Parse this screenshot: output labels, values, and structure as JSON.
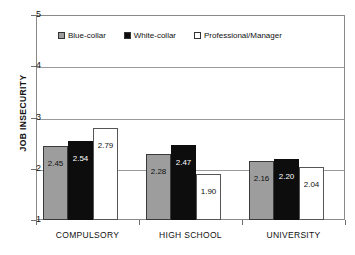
{
  "chart_data": {
    "type": "bar",
    "title": "",
    "xlabel": "",
    "ylabel": "JOB INSECURITY",
    "categories": [
      "COMPULSORY",
      "HIGH SCHOOL",
      "UNIVERSITY"
    ],
    "series": [
      {
        "name": "Blue-collar",
        "values": [
          2.45,
          2.28,
          2.16
        ],
        "color": "#9d9d9d"
      },
      {
        "name": "White-collar",
        "values": [
          2.54,
          2.47,
          2.2
        ],
        "color": "#0d0d0d"
      },
      {
        "name": "Professional/Manager",
        "values": [
          2.79,
          1.9,
          2.04
        ],
        "color": "#ffffff"
      }
    ],
    "value_labels": [
      [
        "2.45",
        "2.54",
        "2.79"
      ],
      [
        "2.28",
        "2.47",
        "1.90"
      ],
      [
        "2.16",
        "2.20",
        "2.04"
      ]
    ],
    "ylim": [
      1,
      5
    ],
    "yticks": [
      1,
      2,
      3,
      4,
      5
    ],
    "ytick_labels": [
      "1",
      "2",
      "3",
      "4",
      "5"
    ],
    "gridlines": [
      2,
      3,
      4,
      5
    ],
    "grid": true,
    "legend_position": "inside-top-left"
  }
}
